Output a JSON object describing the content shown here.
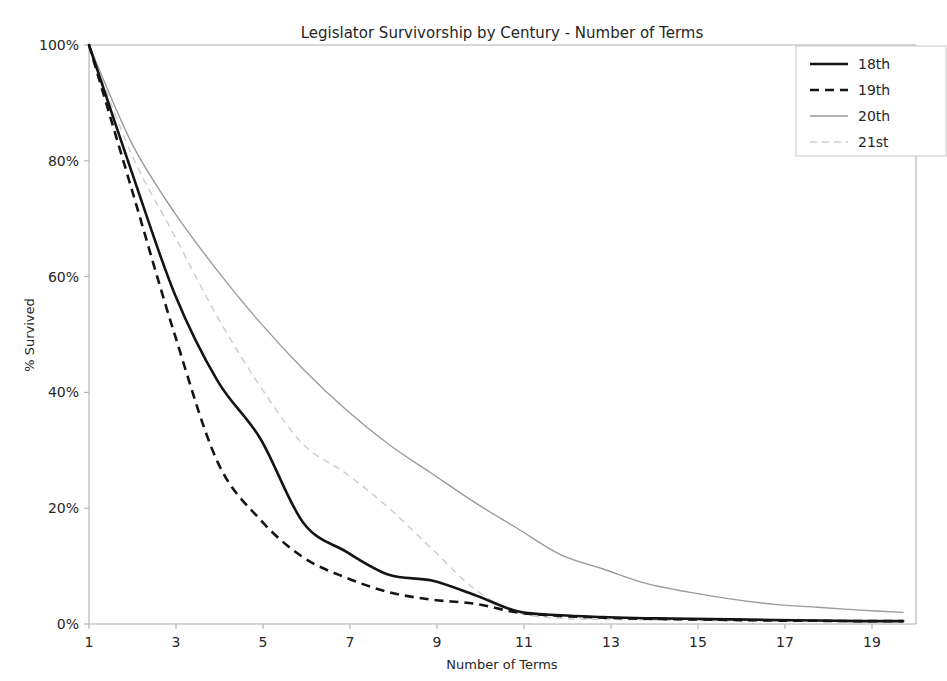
{
  "chart_data": {
    "type": "line",
    "title": "Legislator Survivorship by Century - Number of Terms",
    "xlabel": "Number of Terms",
    "ylabel": "% Survived",
    "xlim": [
      1,
      20.3
    ],
    "ylim": [
      0,
      100
    ],
    "grid": false,
    "legend_position": "upper right",
    "x_ticks": [
      1,
      3,
      5,
      7,
      9,
      11,
      13,
      15,
      17,
      19
    ],
    "x_tick_labels": [
      "1",
      "3",
      "5",
      "7",
      "9",
      "11",
      "13",
      "15",
      "17",
      "19"
    ],
    "y_ticks": [
      0,
      20,
      40,
      60,
      80,
      100
    ],
    "y_tick_labels": [
      "0%",
      "20%",
      "40%",
      "60%",
      "80%",
      "100%"
    ],
    "x": [
      1,
      2,
      3,
      4,
      5,
      6,
      7,
      8,
      9,
      10,
      11,
      12,
      13,
      14,
      15,
      16,
      17,
      18,
      19,
      20
    ],
    "series": [
      {
        "name": "18th",
        "style": "solid",
        "color": "#141414",
        "width": 2.6,
        "values": [
          100,
          78,
          57,
          42,
          32,
          17.5,
          12.5,
          8.5,
          7.5,
          5.0,
          2.2,
          1.5,
          1.2,
          1.0,
          0.9,
          0.8,
          0.7,
          0.6,
          0.5,
          0.5
        ]
      },
      {
        "name": "19th",
        "style": "dashed",
        "color": "#141414",
        "width": 2.6,
        "values": [
          100,
          75,
          50,
          28,
          18,
          11.5,
          8.0,
          5.5,
          4.2,
          3.5,
          2.0,
          1.4,
          1.1,
          0.9,
          0.8,
          0.7,
          0.6,
          0.55,
          0.5,
          0.5
        ]
      },
      {
        "name": "20th",
        "style": "solid",
        "color": "#9a9a9a",
        "width": 1.35,
        "values": [
          100,
          83,
          71,
          61,
          52,
          44,
          37,
          31,
          26,
          21,
          16.5,
          12.0,
          9.5,
          7.0,
          5.5,
          4.3,
          3.4,
          2.9,
          2.4,
          2.0
        ]
      },
      {
        "name": "21st",
        "style": "dashed",
        "color": "#cfcfcf",
        "width": 1.5,
        "values": [
          100,
          81,
          67,
          53,
          41,
          31,
          26,
          20,
          13,
          6.0,
          2.0,
          1.0,
          0.8,
          0.7,
          0.6,
          0.55,
          0.5,
          0.5,
          0.5,
          0.5
        ]
      }
    ],
    "legend_entries": [
      {
        "label": "18th",
        "style": "solid",
        "color": "#141414"
      },
      {
        "label": "19th",
        "style": "dashed",
        "color": "#141414"
      },
      {
        "label": "20th",
        "style": "solid",
        "color": "#9a9a9a"
      },
      {
        "label": "21st",
        "style": "dashed",
        "color": "#cfcfcf"
      }
    ]
  }
}
